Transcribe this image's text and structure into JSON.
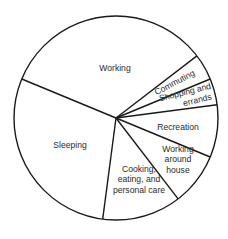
{
  "chart_data": {
    "type": "pie",
    "title": "",
    "unit": "hours per day",
    "total": 24,
    "start_angle_deg": 157.5,
    "direction": "clockwise",
    "categories": [
      "Working",
      "Commuting",
      "Shopping and errands",
      "Recreation",
      "Working around house",
      "Cooking, eating, and personal care",
      "Sleeping"
    ],
    "values": [
      8,
      1,
      1,
      2,
      2,
      3,
      7
    ],
    "slices": [
      {
        "label": "Working",
        "lines": [
          "Working"
        ],
        "value": 8,
        "label_pos": [
          115,
          71
        ],
        "rotate": 0
      },
      {
        "label": "Commuting",
        "lines": [
          "Commuting"
        ],
        "value": 1,
        "label_pos": [
          176,
          85
        ],
        "rotate": -28
      },
      {
        "label": "Shopping and errands",
        "lines": [
          "Shopping and",
          "errands"
        ],
        "value": 1,
        "label_pos": [
          187,
          100
        ],
        "rotate": -14
      },
      {
        "label": "Recreation",
        "lines": [
          "Recreation"
        ],
        "value": 2,
        "label_pos": [
          178,
          130
        ],
        "rotate": 0
      },
      {
        "label": "Working around house",
        "lines": [
          "Working",
          "around",
          "house"
        ],
        "value": 2,
        "label_pos": [
          178,
          162
        ],
        "rotate": 0
      },
      {
        "label": "Cooking, eating, and personal care",
        "lines": [
          "Cooking,",
          "eating, and",
          "personal care"
        ],
        "value": 3,
        "label_pos": [
          139,
          182
        ],
        "rotate": 0
      },
      {
        "label": "Sleeping",
        "lines": [
          "Sleeping"
        ],
        "value": 7,
        "label_pos": [
          70,
          148
        ],
        "rotate": 0
      }
    ],
    "colors": {
      "fill": "#ffffff",
      "stroke": "#1a1a1a",
      "text": "#2a2a2a"
    },
    "legend": "none",
    "grid": false
  }
}
